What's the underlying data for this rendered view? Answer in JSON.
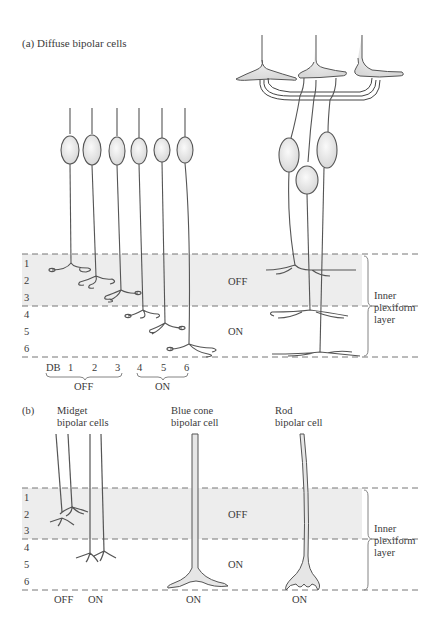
{
  "panel_a": {
    "title": "(a)  Diffuse bipolar cells",
    "layer_numbers": [
      "1",
      "2",
      "3",
      "4",
      "5",
      "6"
    ],
    "sublamina_off": "OFF",
    "sublamina_on": "ON",
    "ipl_label_line1": "Inner",
    "ipl_label_line2": "plexiform",
    "ipl_label_line3": "layer",
    "cell_labels": [
      "DB",
      "1",
      "2",
      "3",
      "4",
      "5",
      "6"
    ],
    "group_off": "OFF",
    "group_on": "ON"
  },
  "panel_b": {
    "tag": "(b)",
    "midget_line1": "Midget",
    "midget_line2": "bipolar cells",
    "blue_line1": "Blue cone",
    "blue_line2": "bipolar cell",
    "rod_line1": "Rod",
    "rod_line2": "bipolar cell",
    "layer_numbers": [
      "1",
      "2",
      "3",
      "4",
      "5",
      "6"
    ],
    "sublamina_off": "OFF",
    "sublamina_on": "ON",
    "ipl_label_line1": "Inner",
    "ipl_label_line2": "plexiform",
    "ipl_label_line3": "layer",
    "midget_off": "OFF",
    "midget_on": "ON",
    "blue_on": "ON",
    "rod_on": "ON"
  },
  "colors": {
    "band": "#ededed",
    "line": "#555555",
    "cell_fill": "#e6e6e6",
    "dash": "#777777"
  }
}
